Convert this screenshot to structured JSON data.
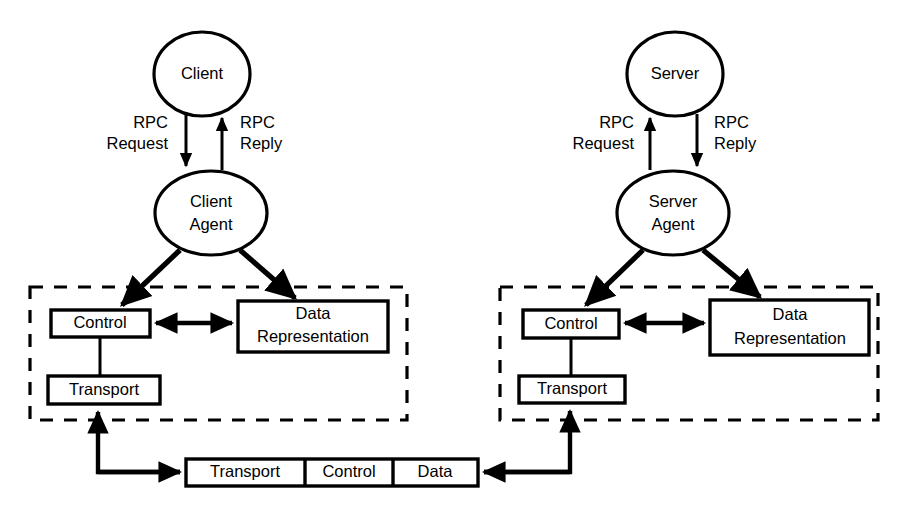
{
  "diagram": {
    "colors": {
      "ink": "#000000",
      "paper": "#ffffff"
    },
    "left_column": {
      "top_node": "Client",
      "agent_node": "Client Agent",
      "agent_line1": "Client",
      "agent_line2": "Agent",
      "request_line1": "RPC",
      "request_line2": "Request",
      "reply_line1": "RPC",
      "reply_line2": "Reply",
      "control_box": "Control",
      "transport_box": "Transport",
      "data_box_line1": "Data",
      "data_box_line2": "Representation"
    },
    "right_column": {
      "top_node": "Server",
      "agent_node": "Server Agent",
      "agent_line1": "Server",
      "agent_line2": "Agent",
      "request_line1": "RPC",
      "request_line2": "Request",
      "reply_line1": "RPC",
      "reply_line2": "Reply",
      "control_box": "Control",
      "transport_box": "Transport",
      "data_box_line1": "Data",
      "data_box_line2": "Representation"
    },
    "packet": {
      "fields": [
        {
          "label": "Transport"
        },
        {
          "label": "Control"
        },
        {
          "label": "Data"
        }
      ]
    }
  }
}
